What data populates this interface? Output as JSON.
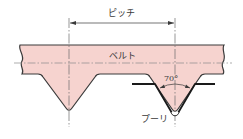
{
  "labels": {
    "pitch": "ピッチ",
    "belt": "ベルト",
    "angle": "70°",
    "pulley": "プーリ"
  },
  "colors": {
    "belt_fill": "#f6d3cf",
    "outline": "#3a3a3a",
    "pulley_line": "#1a1a1a",
    "centerline": "#8a8a8a",
    "background": "#ffffff"
  }
}
